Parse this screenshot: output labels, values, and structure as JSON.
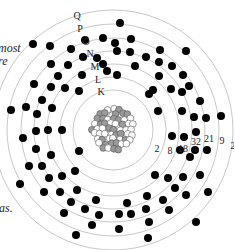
{
  "diagram": {
    "center": {
      "x": 113,
      "y": 130
    },
    "nucleus_radius": 24,
    "nucleus_colors": {
      "proton": "#9a9a9a",
      "neutron": "#ffffff",
      "outline": "#555555"
    },
    "ring_color": "#c8c8c8",
    "electron_color": "#000000",
    "shells": [
      {
        "name": "K",
        "radius": 40,
        "electrons": 2
      },
      {
        "name": "L",
        "radius": 53,
        "electrons": 8
      },
      {
        "name": "M",
        "radius": 66,
        "electrons": 18
      },
      {
        "name": "N",
        "radius": 79,
        "electrons": 32
      },
      {
        "name": "O",
        "radius": 92,
        "electrons": 21
      },
      {
        "name": "P",
        "radius": 106,
        "electrons": 9
      },
      {
        "name": "Q",
        "radius": 120,
        "electrons": 2
      }
    ],
    "shell_labels": [
      {
        "text": "Q",
        "x": 77,
        "y": 16
      },
      {
        "text": "P",
        "x": 80,
        "y": 29
      },
      {
        "text": "O",
        "x": 86,
        "y": 42
      },
      {
        "text": "N",
        "x": 90,
        "y": 54
      },
      {
        "text": "M",
        "x": 95,
        "y": 67
      },
      {
        "text": "L",
        "x": 98,
        "y": 80
      },
      {
        "text": "K",
        "x": 101,
        "y": 92
      }
    ],
    "count_labels": [
      {
        "text": "2",
        "x": 157,
        "y": 149
      },
      {
        "text": "8",
        "x": 170,
        "y": 151
      },
      {
        "text": "18",
        "x": 183,
        "y": 149
      },
      {
        "text": "32",
        "x": 196,
        "y": 142
      },
      {
        "text": "21",
        "x": 209,
        "y": 139
      },
      {
        "text": "9",
        "x": 222,
        "y": 141
      },
      {
        "text": "2",
        "x": 233,
        "y": 146
      }
    ],
    "text_fragments": [
      {
        "text": "most",
        "x": -2,
        "y": 42
      },
      {
        "text": "re",
        "x": -2,
        "y": 55
      },
      {
        "text": "as.",
        "x": -1,
        "y": 202
      }
    ],
    "electrons": [
      [
        33,
        44
      ],
      [
        50,
        46
      ],
      [
        71,
        49
      ],
      [
        85,
        40
      ],
      [
        103,
        38
      ],
      [
        115,
        43
      ],
      [
        97,
        58
      ],
      [
        83,
        57
      ],
      [
        103,
        64
      ],
      [
        107,
        71
      ],
      [
        51,
        64
      ],
      [
        68,
        65
      ],
      [
        58,
        76
      ],
      [
        82,
        75
      ],
      [
        79,
        91
      ],
      [
        34,
        84
      ],
      [
        51,
        87
      ],
      [
        65,
        88
      ],
      [
        42,
        100
      ],
      [
        26,
        107
      ],
      [
        52,
        108
      ],
      [
        11,
        110
      ],
      [
        37,
        114
      ],
      [
        120,
        23
      ],
      [
        131,
        39
      ],
      [
        117,
        51
      ],
      [
        130,
        52
      ],
      [
        146,
        57
      ],
      [
        160,
        50
      ],
      [
        186,
        51
      ],
      [
        135,
        66
      ],
      [
        159,
        62
      ],
      [
        172,
        66
      ],
      [
        159,
        76
      ],
      [
        117,
        75
      ],
      [
        183,
        75
      ],
      [
        171,
        89
      ],
      [
        149,
        94
      ],
      [
        182,
        92
      ],
      [
        189,
        86
      ],
      [
        153,
        90
      ],
      [
        200,
        101
      ],
      [
        158,
        111
      ],
      [
        182,
        111
      ],
      [
        194,
        117
      ],
      [
        206,
        118
      ],
      [
        221,
        116
      ],
      [
        172,
        136
      ],
      [
        184,
        137
      ],
      [
        196,
        132
      ],
      [
        180,
        150
      ],
      [
        195,
        150
      ],
      [
        207,
        150
      ],
      [
        190,
        157
      ],
      [
        155,
        175
      ],
      [
        168,
        178
      ],
      [
        183,
        177
      ],
      [
        200,
        175
      ],
      [
        175,
        188
      ],
      [
        186,
        195
      ],
      [
        208,
        192
      ],
      [
        147,
        196
      ],
      [
        163,
        200
      ],
      [
        127,
        203
      ],
      [
        146,
        209
      ],
      [
        169,
        210
      ],
      [
        119,
        214
      ],
      [
        131,
        214
      ],
      [
        149,
        222
      ],
      [
        196,
        222
      ],
      [
        119,
        229
      ],
      [
        148,
        238
      ],
      [
        23,
        138
      ],
      [
        36,
        131
      ],
      [
        48,
        130
      ],
      [
        62,
        130
      ],
      [
        36,
        149
      ],
      [
        51,
        155
      ],
      [
        79,
        151
      ],
      [
        29,
        166
      ],
      [
        42,
        166
      ],
      [
        49,
        178
      ],
      [
        62,
        176
      ],
      [
        75,
        171
      ],
      [
        20,
        184
      ],
      [
        44,
        192
      ],
      [
        60,
        192
      ],
      [
        77,
        190
      ],
      [
        71,
        202
      ],
      [
        96,
        200
      ],
      [
        85,
        209
      ],
      [
        64,
        213
      ],
      [
        99,
        215
      ],
      [
        92,
        225
      ],
      [
        76,
        235
      ]
    ]
  }
}
